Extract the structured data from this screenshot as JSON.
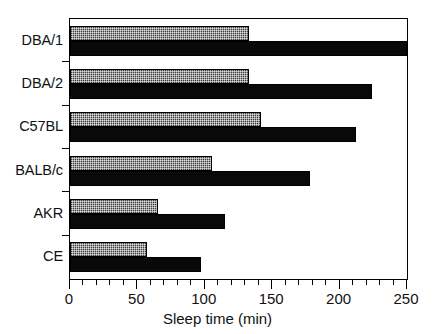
{
  "chart_data": {
    "type": "bar",
    "orientation": "horizontal",
    "title": "",
    "xlabel": "Sleep time (min)",
    "ylabel": "",
    "xlim": [
      0,
      250
    ],
    "ylim": [
      0,
      6
    ],
    "grid": false,
    "legend": "none",
    "xticks": [
      0,
      50,
      100,
      150,
      200,
      250
    ],
    "xtick_labels": [
      "0",
      "50",
      "100",
      "150",
      "200",
      "250"
    ],
    "xminor_tick_step": 10,
    "categories": [
      "DBA/1",
      "DBA/2",
      "C57BL",
      "BALB/c",
      "AKR",
      "CE"
    ],
    "series": [
      {
        "name": "upper",
        "style": "stippled-gray",
        "color": "#3a3a3a",
        "values": [
          133,
          133,
          142,
          105,
          65,
          57
        ]
      },
      {
        "name": "lower",
        "style": "solid-black",
        "color": "#090909",
        "values": [
          250,
          224,
          212,
          178,
          115,
          97
        ]
      }
    ]
  },
  "axis": {
    "x_title": "Sleep time (min)"
  }
}
